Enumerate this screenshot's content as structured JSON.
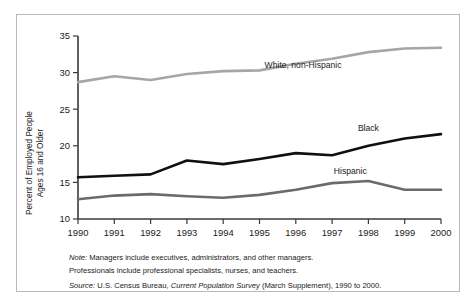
{
  "figure": {
    "y_axis_title_line1": "Percent of Employed People",
    "y_axis_title_line2": "Ages 16 and Older"
  },
  "notes": {
    "note_label": "Note:",
    "note_text_line1": " Managers include executives, administrators, and other managers.",
    "note_text_line2": "Professionals include professional specialists, nurses, and teachers.",
    "source_label": "Source:",
    "source_text_pre": " U.S. Census Bureau, ",
    "source_italic": "Current Population Survey",
    "source_text_post": " (March Supplement), 1990 to 2000."
  },
  "colors": {
    "white_non_hispanic": "#a6a6a6",
    "black": "#101010",
    "hispanic": "#6b6b6b",
    "axis": "#3a3a3a",
    "frame": "#b9b9b9",
    "background": "#ffffff"
  },
  "chart_data": {
    "type": "line",
    "title": "",
    "subtitle": "",
    "xlabel": "",
    "ylabel": "Percent of Employed People Ages 16 and Older",
    "x": [
      1990,
      1991,
      1992,
      1993,
      1994,
      1995,
      1996,
      1997,
      1998,
      1999,
      2000
    ],
    "xtick_labels": [
      "1990",
      "1991",
      "1992",
      "1993",
      "1994",
      "1995",
      "1996",
      "1997",
      "1998",
      "1999",
      "2000"
    ],
    "ytick_labels": [
      "10",
      "15",
      "20",
      "25",
      "30",
      "35"
    ],
    "yticks": [
      10,
      15,
      20,
      25,
      30,
      35
    ],
    "ylim": [
      10,
      35
    ],
    "xlim": [
      1990,
      2000
    ],
    "grid": false,
    "legend": "inline-labels",
    "series": [
      {
        "name": "White, non-Hispanic",
        "color": "#a6a6a6",
        "values": [
          28.7,
          29.5,
          29.0,
          29.8,
          30.2,
          30.3,
          31.2,
          31.9,
          32.8,
          33.3,
          33.4
        ],
        "label_x": 1996.2,
        "label_y": 30.6
      },
      {
        "name": "Black",
        "color": "#101010",
        "values": [
          15.7,
          15.9,
          16.1,
          18.0,
          17.5,
          18.2,
          19.0,
          18.7,
          20.0,
          21.0,
          21.6
        ],
        "label_x": 1998.0,
        "label_y": 22.0
      },
      {
        "name": "Hispanic",
        "color": "#6b6b6b",
        "values": [
          12.7,
          13.2,
          13.4,
          13.1,
          12.9,
          13.3,
          14.0,
          14.9,
          15.2,
          14.0,
          14.0
        ],
        "label_x": 1997.5,
        "label_y": 16.1
      }
    ]
  }
}
